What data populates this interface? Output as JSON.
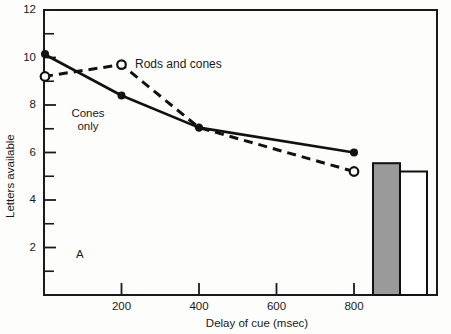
{
  "figure": {
    "panel_label": "A",
    "background_color": "#fdfdfc",
    "frame_color": "#1a1a1a"
  },
  "chart_data": {
    "type": "line",
    "title": "",
    "xlabel": "Delay of cue (msec)",
    "ylabel": "Letters available",
    "xlim": [
      0,
      1000
    ],
    "ylim": [
      0,
      12
    ],
    "xticks": [
      0,
      200,
      400,
      600,
      800
    ],
    "xtick_labels": [
      "",
      "200",
      "400",
      "600",
      "800"
    ],
    "yticks": [
      2,
      4,
      6,
      8,
      10,
      12
    ],
    "ytick_labels": [
      "2",
      "4",
      "6",
      "8",
      "10",
      "12"
    ],
    "yminor_ticks": [
      1,
      3,
      5,
      7,
      9,
      11
    ],
    "grid": false,
    "legend": "inline-annotations",
    "series": [
      {
        "name": "Cones only",
        "label_text": "Cones\nonly",
        "marker": "filled-circle",
        "linestyle": "solid",
        "color": "#111111",
        "x": [
          0,
          200,
          400,
          800
        ],
        "values": [
          10.15,
          8.4,
          7.05,
          6.0
        ]
      },
      {
        "name": "Rods and cones",
        "label_text": "Rods and cones",
        "marker": "open-circle",
        "linestyle": "dashed",
        "color": "#111111",
        "x": [
          0,
          200,
          400,
          800
        ],
        "values": [
          9.2,
          9.7,
          7.05,
          5.2
        ]
      }
    ],
    "bars": [
      {
        "name": "filled-bar",
        "fill": "#999999",
        "edge": "#111111",
        "value": 5.55
      },
      {
        "name": "open-bar",
        "fill": "#ffffff",
        "edge": "#111111",
        "value": 5.2
      }
    ],
    "annotations": [
      {
        "name": "series-label-rods-and-cones",
        "text": "Rods and cones"
      },
      {
        "name": "series-label-cones-only",
        "text": "Cones only"
      },
      {
        "name": "panel-letter",
        "text": "A"
      }
    ]
  }
}
